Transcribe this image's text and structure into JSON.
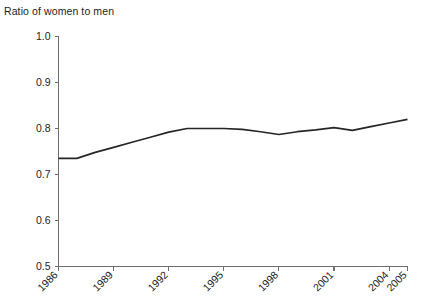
{
  "chart_data": {
    "type": "line",
    "title": "Ratio of women to men",
    "xlabel": "",
    "ylabel": "",
    "ylim": [
      0.5,
      1.0
    ],
    "xlim": [
      1986,
      2005
    ],
    "grid": false,
    "legend": "none",
    "y_ticks": [
      "1.0",
      "0.9",
      "0.8",
      "0.7",
      "0.6",
      "0.5"
    ],
    "y_tick_values": [
      1.0,
      0.9,
      0.8,
      0.7,
      0.6,
      0.5
    ],
    "x_ticks": [
      "1986",
      "1989",
      "1992",
      "1995",
      "1998",
      "2001",
      "2004",
      "2005"
    ],
    "x_tick_values": [
      1986,
      1989,
      1992,
      1995,
      1998,
      2001,
      2004,
      2005
    ],
    "x": [
      1986,
      1987,
      1988,
      1989,
      1990,
      1991,
      1992,
      1993,
      1994,
      1995,
      1996,
      1997,
      1998,
      1999,
      2000,
      2001,
      2002,
      2003,
      2004,
      2005
    ],
    "series": [
      {
        "name": "Ratio of women to men",
        "color": "#262626",
        "values": [
          0.735,
          0.735,
          0.748,
          0.759,
          0.77,
          0.781,
          0.792,
          0.8,
          0.8,
          0.8,
          0.798,
          0.793,
          0.787,
          0.793,
          0.797,
          0.802,
          0.796,
          0.804,
          0.812,
          0.82
        ]
      }
    ]
  },
  "axis": {
    "y_axis_name": "y-axis",
    "x_axis_name": "x-axis"
  }
}
